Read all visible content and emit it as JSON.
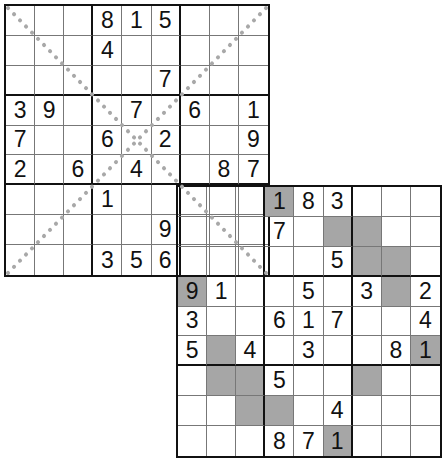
{
  "puzzle": {
    "type": "double-sudoku-x-overlap",
    "grid1": {
      "name": "top-left",
      "diagonal_constraint": true,
      "rows": [
        [
          "",
          "",
          "",
          "8",
          "1",
          "5",
          "",
          "",
          ""
        ],
        [
          "",
          "",
          "",
          "4",
          "",
          "",
          "",
          "",
          ""
        ],
        [
          "",
          "",
          "",
          "",
          "",
          "7",
          "",
          "",
          ""
        ],
        [
          "3",
          "9",
          "",
          "",
          "7",
          "",
          "6",
          "",
          "1"
        ],
        [
          "7",
          "",
          "",
          "6",
          "",
          "2",
          "",
          "",
          "9"
        ],
        [
          "2",
          "",
          "6",
          "",
          "4",
          "",
          "",
          "8",
          "7"
        ],
        [
          "",
          "",
          "",
          "1",
          "",
          "",
          "",
          "",
          ""
        ],
        [
          "",
          "",
          "",
          "",
          "",
          "9",
          "",
          "",
          ""
        ],
        [
          "",
          "",
          "",
          "3",
          "5",
          "6",
          "",
          "",
          ""
        ]
      ]
    },
    "grid2": {
      "name": "bottom-right",
      "shaded_constraint": true,
      "rows": [
        [
          "",
          "",
          "",
          "1",
          "8",
          "3",
          "",
          "",
          ""
        ],
        [
          "",
          "",
          "",
          "7",
          "",
          "",
          "",
          "",
          ""
        ],
        [
          "",
          "",
          "",
          "",
          "",
          "5",
          "",
          "",
          ""
        ],
        [
          "9",
          "1",
          "",
          "",
          "5",
          "",
          "3",
          "",
          "2"
        ],
        [
          "3",
          "",
          "",
          "6",
          "1",
          "7",
          "",
          "",
          "4"
        ],
        [
          "5",
          "",
          "4",
          "",
          "3",
          "",
          "",
          "8",
          "1"
        ],
        [
          "",
          "",
          "",
          "5",
          "",
          "",
          "",
          "",
          ""
        ],
        [
          "",
          "",
          "",
          "",
          "",
          "4",
          "",
          "",
          ""
        ],
        [
          "",
          "",
          "",
          "8",
          "7",
          "1",
          "",
          "",
          ""
        ]
      ],
      "shaded": [
        [
          0,
          3
        ],
        [
          1,
          5
        ],
        [
          1,
          6
        ],
        [
          2,
          6
        ],
        [
          2,
          7
        ],
        [
          3,
          0
        ],
        [
          3,
          7
        ],
        [
          5,
          1
        ],
        [
          5,
          8
        ],
        [
          6,
          1
        ],
        [
          6,
          2
        ],
        [
          6,
          6
        ],
        [
          7,
          2
        ],
        [
          7,
          3
        ],
        [
          8,
          5
        ]
      ]
    },
    "colors": {
      "shade": "#a6a6a6",
      "diagonal_dots": "#a8a8a8",
      "grid_line": "#111111",
      "thin_line": "#777777"
    }
  }
}
